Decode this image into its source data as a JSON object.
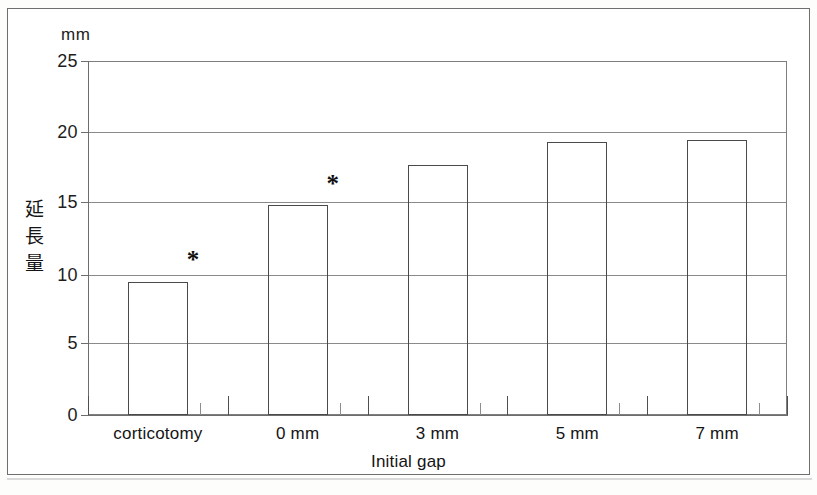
{
  "figure": {
    "unit_label": "mm",
    "y_axis_title": "延長量",
    "x_axis_title": "Initial gap"
  },
  "chart_data": {
    "type": "bar",
    "title": "",
    "subtitle": "",
    "xlabel": "Initial gap",
    "ylabel": "延長量",
    "yunit": "mm",
    "categories": [
      "corticotomy",
      "0 mm",
      "3 mm",
      "5 mm",
      "7 mm"
    ],
    "values": [
      9.4,
      14.8,
      17.65,
      19.3,
      19.45
    ],
    "ylim": [
      0,
      25
    ],
    "ytick_labels": [
      "0",
      "5",
      "10",
      "15",
      "20",
      "25"
    ],
    "ytick_values": [
      0,
      5,
      10,
      15,
      20,
      25
    ],
    "grid": true,
    "grid_axis": "y",
    "legend": "none",
    "bar_fill": "none",
    "bar_edge_color": "#4a4a4a",
    "annotations": [
      {
        "text": "*",
        "category": "corticotomy",
        "value": 11.0
      },
      {
        "text": "*",
        "category": "0 mm",
        "value": 16.4
      }
    ]
  },
  "y_axis": {
    "ticks": [
      {
        "label": "25",
        "value": 25
      },
      {
        "label": "20",
        "value": 20
      },
      {
        "label": "15",
        "value": 15
      },
      {
        "label": "10",
        "value": 10
      },
      {
        "label": "5",
        "value": 5
      },
      {
        "label": "0",
        "value": 0
      }
    ]
  },
  "x_axis": {
    "labels": [
      "corticotomy",
      "0 mm",
      "3 mm",
      "5 mm",
      "7 mm"
    ]
  }
}
